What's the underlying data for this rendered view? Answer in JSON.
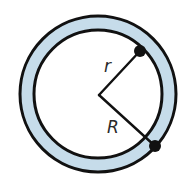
{
  "diagram": {
    "labels": {
      "inner_radius": "r",
      "outer_radius": "R"
    },
    "colors": {
      "ring_fill": "#c6dcea",
      "stroke": "#111111",
      "background": "#ffffff"
    },
    "geometry": {
      "center": [
        98,
        94
      ],
      "outer_radius": 78,
      "inner_radius": 64,
      "inner_point": [
        140,
        51
      ],
      "outer_point": [
        155,
        146
      ]
    }
  }
}
